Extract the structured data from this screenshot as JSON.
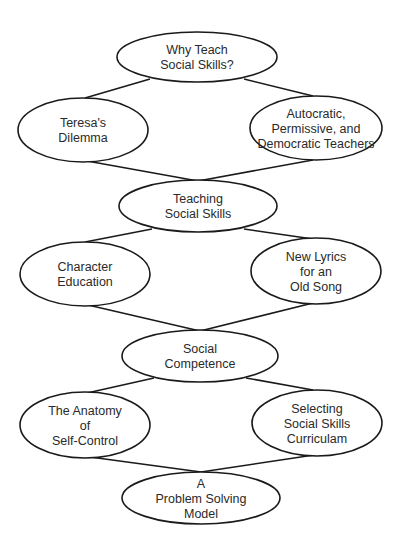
{
  "diagram": {
    "type": "flow-chain",
    "colors": {
      "stroke": "#1a1a1a",
      "fill": "#ffffff",
      "text": "#2a2a2a"
    },
    "nodes": [
      {
        "id": "why-teach",
        "cx": 197,
        "cy": 57,
        "rx": 80,
        "ry": 25,
        "lines": [
          "Why Teach",
          "Social Skills?"
        ]
      },
      {
        "id": "teresas-dilemma",
        "cx": 83,
        "cy": 130,
        "rx": 65,
        "ry": 32,
        "lines": [
          "Teresa's",
          "Dilemma"
        ]
      },
      {
        "id": "autocratic",
        "cx": 316,
        "cy": 128,
        "rx": 66,
        "ry": 32,
        "lines": [
          "Autocratic,",
          "Permissive, and",
          "Democratic Teachers"
        ]
      },
      {
        "id": "teaching-social-skills",
        "cx": 198,
        "cy": 206,
        "rx": 79,
        "ry": 26,
        "lines": [
          "Teaching",
          "Social Skills"
        ]
      },
      {
        "id": "character-education",
        "cx": 85,
        "cy": 274,
        "rx": 65,
        "ry": 32,
        "lines": [
          "Character",
          "Education"
        ]
      },
      {
        "id": "new-lyrics",
        "cx": 316,
        "cy": 271,
        "rx": 65,
        "ry": 33,
        "lines": [
          "New Lyrics",
          "for an",
          "Old Song"
        ]
      },
      {
        "id": "social-competence",
        "cx": 200,
        "cy": 356,
        "rx": 78,
        "ry": 26,
        "lines": [
          "Social",
          "Competence"
        ]
      },
      {
        "id": "anatomy-self-control",
        "cx": 85,
        "cy": 425,
        "rx": 65,
        "ry": 33,
        "lines": [
          "The Anatomy",
          "of",
          "Self-Control"
        ]
      },
      {
        "id": "selecting-curriculum",
        "cx": 317,
        "cy": 423,
        "rx": 65,
        "ry": 33,
        "lines": [
          "Selecting",
          "Social Skills",
          "Curriculam"
        ]
      },
      {
        "id": "problem-solving",
        "cx": 201,
        "cy": 498,
        "rx": 79,
        "ry": 26,
        "lines": [
          "A",
          "Problem Solving",
          "Model"
        ]
      }
    ],
    "edges": [
      {
        "from": "why-teach",
        "to": "teresas-dilemma",
        "x1": 150,
        "y1": 79,
        "x2": 85,
        "y2": 98
      },
      {
        "from": "why-teach",
        "to": "autocratic",
        "x1": 244,
        "y1": 79,
        "x2": 313,
        "y2": 96
      },
      {
        "from": "teresas-dilemma",
        "to": "teaching-social-skills",
        "x1": 87,
        "y1": 161,
        "x2": 198,
        "y2": 181
      },
      {
        "from": "autocratic",
        "to": "teaching-social-skills",
        "x1": 313,
        "y1": 160,
        "x2": 198,
        "y2": 181
      },
      {
        "from": "teaching-social-skills",
        "to": "character-education",
        "x1": 152,
        "y1": 229,
        "x2": 85,
        "y2": 242
      },
      {
        "from": "teaching-social-skills",
        "to": "new-lyrics",
        "x1": 244,
        "y1": 229,
        "x2": 313,
        "y2": 239
      },
      {
        "from": "character-education",
        "to": "social-competence",
        "x1": 88,
        "y1": 305,
        "x2": 200,
        "y2": 331
      },
      {
        "from": "new-lyrics",
        "to": "social-competence",
        "x1": 313,
        "y1": 303,
        "x2": 200,
        "y2": 331
      },
      {
        "from": "social-competence",
        "to": "anatomy-self-control",
        "x1": 154,
        "y1": 378,
        "x2": 87,
        "y2": 393
      },
      {
        "from": "social-competence",
        "to": "selecting-curriculum",
        "x1": 246,
        "y1": 378,
        "x2": 313,
        "y2": 390
      },
      {
        "from": "anatomy-self-control",
        "to": "problem-solving",
        "x1": 90,
        "y1": 457,
        "x2": 201,
        "y2": 472
      },
      {
        "from": "selecting-curriculum",
        "to": "problem-solving",
        "x1": 314,
        "y1": 455,
        "x2": 201,
        "y2": 472
      }
    ]
  }
}
